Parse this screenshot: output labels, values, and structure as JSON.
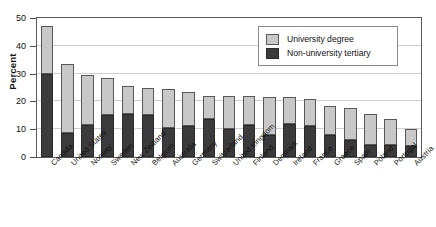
{
  "figure": {
    "cut_off_title_fragment": "",
    "ylabel": "Percent"
  },
  "legend": {
    "items": [
      {
        "label": "University degree",
        "color": "#c8c8c8",
        "key": "university_degree"
      },
      {
        "label": "Non-university tertiary",
        "color": "#3b3b3b",
        "key": "non_university_tertiary"
      }
    ]
  },
  "axis": {
    "yticks": [
      0,
      10,
      20,
      30,
      40,
      50
    ],
    "ytick_labels": [
      "0",
      "10",
      "20",
      "30",
      "40",
      "50"
    ]
  },
  "chart_data": {
    "type": "bar",
    "stacked": true,
    "title": "",
    "xlabel": "",
    "ylabel": "Percent",
    "ylim": [
      0,
      50
    ],
    "grid": true,
    "legend_position": "top-right",
    "categories": [
      "Canada",
      "United States",
      "Norway",
      "Sweden",
      "New Zealand",
      "Belgium",
      "Australia",
      "Germany",
      "Switzerland",
      "United Kingdom",
      "Finland",
      "Denmark",
      "Ireland",
      "France",
      "Greece",
      "Spain",
      "Poland",
      "Portugal",
      "Austria"
    ],
    "series": [
      {
        "name": "Non-university tertiary",
        "color": "#3b3b3b",
        "values": [
          30,
          8.5,
          11.5,
          15,
          15.5,
          15,
          10.5,
          11,
          13.5,
          10,
          11.5,
          8,
          12,
          11,
          8,
          6,
          4.5,
          4.5,
          4
        ]
      },
      {
        "name": "University degree",
        "color": "#c8c8c8",
        "values": [
          17,
          25,
          18,
          13.5,
          10,
          10,
          14,
          12.5,
          8.5,
          12,
          10.5,
          13.5,
          9.5,
          10,
          10.5,
          11.5,
          11,
          9,
          6
        ]
      }
    ],
    "totals": [
      47,
      33.5,
      29.5,
      28.5,
      25.5,
      25,
      24.5,
      23.5,
      22,
      22,
      22,
      21.5,
      21.5,
      21,
      18.5,
      17.5,
      15.5,
      13.5,
      10
    ]
  }
}
